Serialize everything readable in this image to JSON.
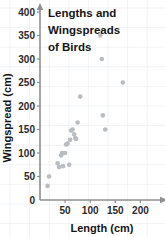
{
  "chart_data": {
    "type": "scatter",
    "title_lines": [
      "Lengths and",
      "Wingspreads",
      "of Birds"
    ],
    "xlabel": "Length (cm)",
    "ylabel": "Wingspread (cm)",
    "xlim": [
      0,
      235
    ],
    "ylim": [
      0,
      400
    ],
    "xticks": [
      50,
      100,
      150,
      200
    ],
    "xtick_labels": [
      "50",
      "100",
      "150",
      "200"
    ],
    "yticks": [
      0,
      50,
      100,
      150,
      200,
      250,
      300,
      350,
      400
    ],
    "ytick_labels": [
      "0",
      "50",
      "100",
      "150",
      "200",
      "250",
      "300",
      "350",
      "400"
    ],
    "grid": true,
    "legend": false,
    "marker_color": "#b9bcc0",
    "points": [
      {
        "x": 15,
        "y": 30
      },
      {
        "x": 18,
        "y": 50
      },
      {
        "x": 35,
        "y": 78
      },
      {
        "x": 38,
        "y": 70
      },
      {
        "x": 42,
        "y": 95
      },
      {
        "x": 44,
        "y": 100
      },
      {
        "x": 46,
        "y": 72
      },
      {
        "x": 50,
        "y": 100
      },
      {
        "x": 52,
        "y": 118
      },
      {
        "x": 55,
        "y": 120
      },
      {
        "x": 58,
        "y": 75
      },
      {
        "x": 60,
        "y": 128
      },
      {
        "x": 62,
        "y": 148
      },
      {
        "x": 65,
        "y": 150
      },
      {
        "x": 68,
        "y": 140
      },
      {
        "x": 70,
        "y": 132
      },
      {
        "x": 72,
        "y": 130
      },
      {
        "x": 75,
        "y": 165
      },
      {
        "x": 80,
        "y": 220
      },
      {
        "x": 120,
        "y": 350
      },
      {
        "x": 123,
        "y": 300
      },
      {
        "x": 125,
        "y": 180
      },
      {
        "x": 130,
        "y": 150
      },
      {
        "x": 165,
        "y": 250
      }
    ]
  }
}
